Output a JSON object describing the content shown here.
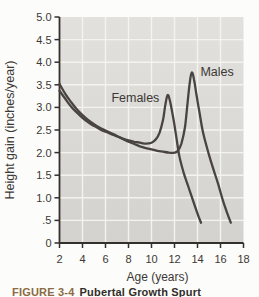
{
  "caption": {
    "label": "FIGURE 3-4",
    "title": "Pubertal Growth Spurt"
  },
  "chart_data": {
    "type": "line",
    "title": "",
    "xlabel": "Age (years)",
    "ylabel": "Height gain (inches/year)",
    "xlim": [
      2,
      18
    ],
    "ylim": [
      0,
      5
    ],
    "grid": true,
    "legend": "inline-labels",
    "background_top": "#e2e1de",
    "background_bottom": "#d3d2ce",
    "grid_color": "#f4f3f0",
    "axis_color": "#33302d",
    "line_color": "#494440",
    "text_color": "#3b3835",
    "x_ticks": [
      {
        "v": 2,
        "label": "2"
      },
      {
        "v": 4,
        "label": "4"
      },
      {
        "v": 6,
        "label": "6"
      },
      {
        "v": 8,
        "label": "8"
      },
      {
        "v": 10,
        "label": "10"
      },
      {
        "v": 12,
        "label": "12"
      },
      {
        "v": 14,
        "label": "14"
      },
      {
        "v": 16,
        "label": "16"
      },
      {
        "v": 18,
        "label": "18"
      }
    ],
    "y_ticks": [
      {
        "v": 5.0,
        "label": "5.0"
      },
      {
        "v": 4.5,
        "label": "4.5"
      },
      {
        "v": 4.0,
        "label": "4.0"
      },
      {
        "v": 3.5,
        "label": "3.5"
      },
      {
        "v": 3.0,
        "label": "3.0"
      },
      {
        "v": 2.5,
        "label": "2.5"
      },
      {
        "v": 2.0,
        "label": "2.0"
      },
      {
        "v": 1.5,
        "label": "1.5"
      },
      {
        "v": 1.0,
        "label": "1.0"
      },
      {
        "v": 0.5,
        "label": ".5"
      },
      {
        "v": 0,
        "label": "0"
      }
    ],
    "series": [
      {
        "name": "Females",
        "label_at": [
          8.6,
          3.2
        ],
        "peak": {
          "age": 11.4,
          "value": 3.27
        },
        "points": [
          [
            2,
            3.37
          ],
          [
            2.5,
            3.19
          ],
          [
            3,
            3.02
          ],
          [
            3.5,
            2.89
          ],
          [
            4,
            2.77
          ],
          [
            4.5,
            2.67
          ],
          [
            5,
            2.59
          ],
          [
            5.5,
            2.52
          ],
          [
            6,
            2.46
          ],
          [
            6.5,
            2.41
          ],
          [
            7,
            2.36
          ],
          [
            7.5,
            2.31
          ],
          [
            8,
            2.27
          ],
          [
            8.5,
            2.24
          ],
          [
            9,
            2.22
          ],
          [
            9.5,
            2.2
          ],
          [
            10,
            2.22
          ],
          [
            10.4,
            2.3
          ],
          [
            10.7,
            2.44
          ],
          [
            11,
            2.72
          ],
          [
            11.2,
            3.05
          ],
          [
            11.4,
            3.27
          ],
          [
            11.6,
            3.15
          ],
          [
            11.9,
            2.75
          ],
          [
            12.1,
            2.45
          ],
          [
            12.4,
            1.95
          ],
          [
            12.8,
            1.55
          ],
          [
            13.2,
            1.25
          ],
          [
            13.6,
            0.95
          ],
          [
            14,
            0.65
          ],
          [
            14.3,
            0.45
          ]
        ]
      },
      {
        "name": "Males",
        "label_at": [
          15.7,
          3.78
        ],
        "peak": {
          "age": 13.5,
          "value": 3.77
        },
        "points": [
          [
            2,
            3.52
          ],
          [
            2.5,
            3.3
          ],
          [
            3,
            3.12
          ],
          [
            3.5,
            2.96
          ],
          [
            4,
            2.83
          ],
          [
            4.5,
            2.72
          ],
          [
            5,
            2.63
          ],
          [
            5.5,
            2.55
          ],
          [
            6,
            2.49
          ],
          [
            6.5,
            2.43
          ],
          [
            7,
            2.37
          ],
          [
            7.5,
            2.3
          ],
          [
            8,
            2.24
          ],
          [
            8.5,
            2.19
          ],
          [
            9,
            2.14
          ],
          [
            9.5,
            2.1
          ],
          [
            10,
            2.07
          ],
          [
            10.5,
            2.04
          ],
          [
            11,
            2.02
          ],
          [
            11.5,
            2.0
          ],
          [
            12,
            2.0
          ],
          [
            12.3,
            2.04
          ],
          [
            12.6,
            2.2
          ],
          [
            12.9,
            2.55
          ],
          [
            13.1,
            3.0
          ],
          [
            13.3,
            3.5
          ],
          [
            13.5,
            3.77
          ],
          [
            13.7,
            3.62
          ],
          [
            13.9,
            3.3
          ],
          [
            14.2,
            2.85
          ],
          [
            14.5,
            2.42
          ],
          [
            15,
            1.95
          ],
          [
            15.4,
            1.62
          ],
          [
            15.8,
            1.3
          ],
          [
            16.2,
            0.95
          ],
          [
            16.6,
            0.65
          ],
          [
            16.9,
            0.45
          ]
        ]
      }
    ]
  }
}
